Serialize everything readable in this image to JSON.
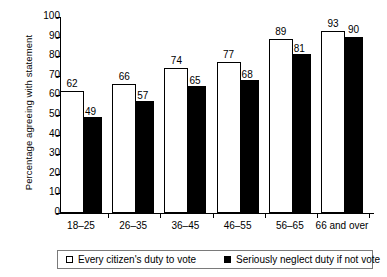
{
  "chart_data": {
    "type": "bar",
    "title": "",
    "xlabel": "",
    "ylabel": "Percentage agreeing with statement",
    "ylim": [
      0,
      100
    ],
    "ytick_step": 10,
    "yticks": [
      100,
      90,
      80,
      70,
      60,
      50,
      40,
      30,
      20,
      10,
      0
    ],
    "grid": false,
    "legend_position": "bottom",
    "categories": [
      "18–25",
      "26–35",
      "36–45",
      "46–55",
      "56–65",
      "66 and over"
    ],
    "series": [
      {
        "name": "Every citizen's duty to vote",
        "color": "#ffffff",
        "values": [
          62,
          66,
          74,
          77,
          89,
          93
        ]
      },
      {
        "name": "Seriously neglect duty if not vote",
        "color": "#000000",
        "values": [
          49,
          57,
          65,
          68,
          81,
          90
        ]
      }
    ]
  },
  "axis": {
    "y_title": "Percentage agreeing with statement",
    "y_tick_labels": [
      "100",
      "90",
      "80",
      "70",
      "60",
      "50",
      "40",
      "30",
      "20",
      "10",
      "0"
    ],
    "x_tick_labels": [
      "18–25",
      "26–35",
      "36–45",
      "46–55",
      "56–65",
      "66 and over"
    ]
  },
  "values": {
    "light": [
      "62",
      "66",
      "74",
      "77",
      "89",
      "93"
    ],
    "dark": [
      "49",
      "57",
      "65",
      "68",
      "81",
      "90"
    ]
  },
  "legend": {
    "items": [
      {
        "label": "Every citizen's duty to vote",
        "swatch": "open-square-swatch"
      },
      {
        "label": "Seriously neglect duty if not vote",
        "swatch": "filled-square-swatch"
      }
    ]
  }
}
